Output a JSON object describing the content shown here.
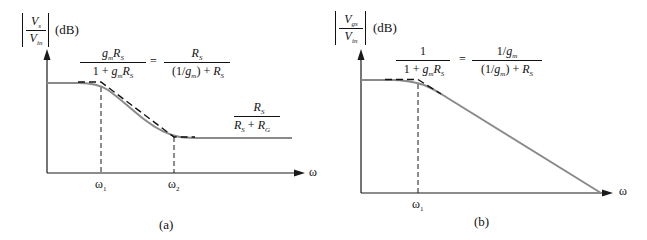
{
  "panels": [
    {
      "id": "a",
      "caption": "(a)",
      "y_axis_label": {
        "numerator": "V",
        "numerator_sub": "s",
        "denominator": "V",
        "denominator_sub": "in",
        "unit": "(dB)"
      },
      "x_axis_label": "ω",
      "tick_labels": [
        {
          "base": "ω",
          "sub": "1"
        },
        {
          "base": "ω",
          "sub": "2"
        }
      ],
      "top_formula": {
        "left_num": "gmRS",
        "left_den": "1 + gmRS",
        "equals": "=",
        "right_num": "RS",
        "right_den": "(1/gm) + RS"
      },
      "bottom_formula": {
        "num": "RS",
        "den": "RS + RG"
      }
    },
    {
      "id": "b",
      "caption": "(b)",
      "y_axis_label": {
        "numerator": "V",
        "numerator_sub": "gs",
        "denominator": "V",
        "denominator_sub": "in",
        "unit": "(dB)"
      },
      "x_axis_label": "ω",
      "tick_labels": [
        {
          "base": "ω",
          "sub": "1"
        }
      ],
      "top_formula": {
        "left_num": "1",
        "left_den": "1 + gmRS",
        "equals": "=",
        "right_num": "1/gm",
        "right_den": "(1/gm) + RS"
      }
    }
  ],
  "colors": {
    "axis": "#1a1a1a",
    "curve": "#8a8a8a",
    "asymptote": "#111111"
  }
}
